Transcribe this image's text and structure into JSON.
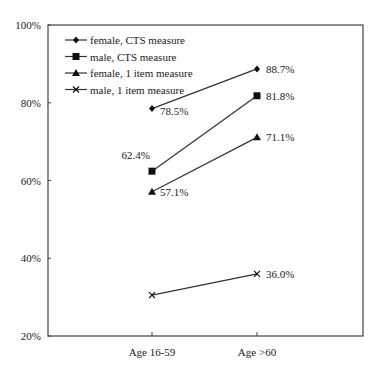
{
  "chart_data": {
    "type": "line",
    "title": "",
    "xlabel": "",
    "ylabel": "",
    "categories": [
      "Age 16-59",
      "Age >60"
    ],
    "ylim": [
      20,
      100
    ],
    "yticks": [
      "20%",
      "40%",
      "60%",
      "80%",
      "100%"
    ],
    "grid": false,
    "legend_position": "upper-left inside",
    "series": [
      {
        "name": "female, CTS measure",
        "marker": "diamond",
        "values": [
          78.5,
          88.7
        ],
        "labels": [
          "78.5%",
          "88.7%"
        ]
      },
      {
        "name": "male, CTS measure",
        "marker": "square",
        "values": [
          62.4,
          81.8
        ],
        "labels": [
          "62.4%",
          "81.8%"
        ]
      },
      {
        "name": "female, 1 item measure",
        "marker": "triangle",
        "values": [
          57.1,
          71.1
        ],
        "labels": [
          "57.1%",
          "71.1%"
        ]
      },
      {
        "name": "male, 1 item measure",
        "marker": "x",
        "values": [
          30.5,
          36.0
        ],
        "labels": [
          "",
          "36.0%"
        ]
      }
    ]
  },
  "colors": {
    "line": "#333333",
    "axis": "#444444",
    "text": "#222222"
  }
}
